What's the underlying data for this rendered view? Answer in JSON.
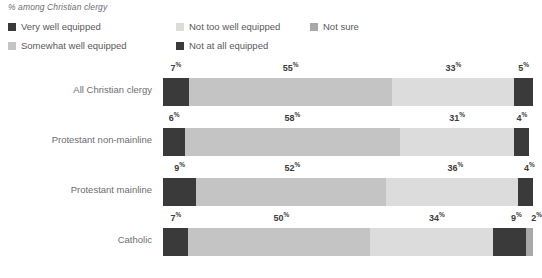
{
  "subtitle": "% among Christian clergy",
  "legend": {
    "items": [
      {
        "label": "Very well equipped",
        "color": "#3a3a3a",
        "icon": "legend-swatch-icon"
      },
      {
        "label": "Somewhat well equipped",
        "color": "#c4c4c4",
        "icon": "legend-swatch-icon"
      },
      {
        "label": "Not too well equipped",
        "color": "#dcdcdc",
        "icon": "legend-swatch-icon"
      },
      {
        "label": "Not at all equipped",
        "color": "#3a3a3a",
        "icon": "legend-swatch-icon"
      },
      {
        "label": "Not sure",
        "color": "#a8a8a8",
        "icon": "legend-swatch-icon"
      }
    ]
  },
  "chart_data": {
    "type": "bar",
    "subtype": "stacked-horizontal-100",
    "title": "",
    "subtitle": "% among Christian clergy",
    "xlabel": "",
    "ylabel": "",
    "xlim": [
      0,
      100
    ],
    "grid": false,
    "legend_position": "top",
    "categories": [
      "All Christian clergy",
      "Protestant non-mainline",
      "Protestant mainline",
      "Catholic"
    ],
    "series": [
      {
        "name": "Very well equipped",
        "color": "#3a3a3a",
        "values": [
          7,
          6,
          9,
          7
        ]
      },
      {
        "name": "Somewhat well equipped",
        "color": "#c4c4c4",
        "values": [
          55,
          58,
          52,
          50
        ]
      },
      {
        "name": "Not too well equipped",
        "color": "#dcdcdc",
        "values": [
          33,
          31,
          36,
          34
        ]
      },
      {
        "name": "Not at all equipped",
        "color": "#3a3a3a",
        "values": [
          5,
          4,
          4,
          9
        ]
      },
      {
        "name": "Not sure",
        "color": "#a8a8a8",
        "values": [
          0,
          0,
          0,
          2
        ]
      }
    ],
    "rows": [
      {
        "category": "All Christian clergy",
        "segments": [
          {
            "name": "Very well equipped",
            "value": 7,
            "label": "7",
            "suffix": "%",
            "color": "#3a3a3a",
            "show_label": true
          },
          {
            "name": "Somewhat well equipped",
            "value": 55,
            "label": "55",
            "suffix": "%",
            "color": "#c4c4c4",
            "show_label": true
          },
          {
            "name": "Not too well equipped",
            "value": 33,
            "label": "33",
            "suffix": "%",
            "color": "#dcdcdc",
            "show_label": true
          },
          {
            "name": "Not at all equipped",
            "value": 5,
            "label": "5",
            "suffix": "%",
            "color": "#3a3a3a",
            "show_label": true
          }
        ]
      },
      {
        "category": "Protestant non-mainline",
        "segments": [
          {
            "name": "Very well equipped",
            "value": 6,
            "label": "6",
            "suffix": "%",
            "color": "#3a3a3a",
            "show_label": true
          },
          {
            "name": "Somewhat well equipped",
            "value": 58,
            "label": "58",
            "suffix": "%",
            "color": "#c4c4c4",
            "show_label": true
          },
          {
            "name": "Not too well equipped",
            "value": 31,
            "label": "31",
            "suffix": "%",
            "color": "#dcdcdc",
            "show_label": true
          },
          {
            "name": "Not at all equipped",
            "value": 4,
            "label": "4",
            "suffix": "%",
            "color": "#3a3a3a",
            "show_label": true
          }
        ]
      },
      {
        "category": "Protestant mainline",
        "segments": [
          {
            "name": "Very well equipped",
            "value": 9,
            "label": "9",
            "suffix": "%",
            "color": "#3a3a3a",
            "show_label": true
          },
          {
            "name": "Somewhat well equipped",
            "value": 52,
            "label": "52",
            "suffix": "%",
            "color": "#c4c4c4",
            "show_label": true
          },
          {
            "name": "Not too well equipped",
            "value": 36,
            "label": "36",
            "suffix": "%",
            "color": "#dcdcdc",
            "show_label": true
          },
          {
            "name": "Not at all equipped",
            "value": 4,
            "label": "4",
            "suffix": "%",
            "color": "#3a3a3a",
            "show_label": true
          }
        ]
      },
      {
        "category": "Catholic",
        "segments": [
          {
            "name": "Very well equipped",
            "value": 7,
            "label": "7",
            "suffix": "%",
            "color": "#3a3a3a",
            "show_label": true
          },
          {
            "name": "Somewhat well equipped",
            "value": 50,
            "label": "50",
            "suffix": "%",
            "color": "#c4c4c4",
            "show_label": true
          },
          {
            "name": "Not too well equipped",
            "value": 34,
            "label": "34",
            "suffix": "%",
            "color": "#dcdcdc",
            "show_label": true
          },
          {
            "name": "Not at all equipped",
            "value": 9,
            "label": "9",
            "suffix": "%",
            "color": "#3a3a3a",
            "show_label": true
          },
          {
            "name": "Not sure",
            "value": 2,
            "label": "2",
            "suffix": "%",
            "color": "#a8a8a8",
            "show_label": true
          }
        ]
      }
    ]
  }
}
